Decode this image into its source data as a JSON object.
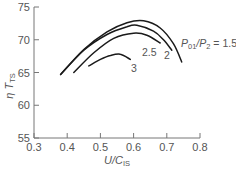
{
  "chart_data": {
    "type": "line",
    "title": "",
    "xlabel": "U/C",
    "xlabel_sub": "IS",
    "ylabel": "η T",
    "ylabel_sub": "TS",
    "xlim": [
      0.3,
      0.8
    ],
    "ylim": [
      55,
      75
    ],
    "xticks": [
      0.3,
      0.4,
      0.5,
      0.6,
      0.7,
      0.8
    ],
    "xtick_labels": [
      "0.3",
      "0.4",
      "0.5",
      "0.6",
      "0.7",
      "0.8"
    ],
    "yticks": [
      55,
      60,
      65,
      70,
      75
    ],
    "ytick_labels": [
      "55",
      "60",
      "65",
      "70",
      "75"
    ],
    "grid": false,
    "legend": "inline curve labels",
    "series": [
      {
        "name": "P01/P2 = 1.5",
        "label": "P01/P2 = 1.5",
        "x": [
          0.38,
          0.45,
          0.52,
          0.58,
          0.63,
          0.68,
          0.72,
          0.745
        ],
        "y": [
          64.7,
          68.5,
          71.2,
          72.6,
          72.9,
          71.8,
          69.4,
          66.6
        ]
      },
      {
        "name": "2",
        "label": "2",
        "x": [
          0.38,
          0.45,
          0.52,
          0.58,
          0.61,
          0.66,
          0.69,
          0.715
        ],
        "y": [
          64.7,
          68.4,
          70.8,
          72.0,
          72.2,
          71.3,
          70.0,
          68.4
        ]
      },
      {
        "name": "2.5",
        "label": "2.5",
        "x": [
          0.42,
          0.48,
          0.54,
          0.6,
          0.64,
          0.68
        ],
        "y": [
          65.0,
          68.0,
          70.2,
          71.0,
          70.7,
          69.5
        ]
      },
      {
        "name": "3",
        "label": "3",
        "x": [
          0.465,
          0.5,
          0.53,
          0.56,
          0.59
        ],
        "y": [
          66.0,
          67.0,
          67.6,
          67.8,
          67.0
        ]
      }
    ]
  },
  "labels": {
    "y_title": "η T",
    "y_title_sub": "TS",
    "x_title": "U/C",
    "x_title_sub": "IS",
    "legend_prefix_p": "P",
    "legend_sub1": "01",
    "legend_mid": "/P",
    "legend_sub2": "2",
    "legend_suffix": " = 1.5",
    "curve_2": "2",
    "curve_25": "2.5",
    "curve_3": "3"
  }
}
